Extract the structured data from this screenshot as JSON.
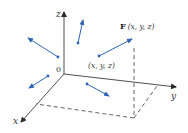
{
  "diagram": {
    "colors": {
      "axis": "#3a3a3a",
      "vector": "#2f64b5",
      "dashed": "#3a3a3a",
      "text": "#333333"
    },
    "axes": {
      "origin_label": "0",
      "x_label": "x",
      "y_label": "y",
      "z_label": "z"
    },
    "point_label": "(x, y, z)",
    "vector_label_bold": "F",
    "vector_label_args": "(x, y, z)",
    "vectors": [
      {
        "from": [
          58,
          57
        ],
        "to": [
          28,
          38
        ]
      },
      {
        "from": [
          78,
          43
        ],
        "to": [
          83,
          20
        ]
      },
      {
        "from": [
          48,
          76
        ],
        "to": [
          29,
          88
        ]
      },
      {
        "from": [
          99,
          56
        ],
        "to": [
          132,
          38
        ]
      },
      {
        "from": [
          87,
          84
        ],
        "to": [
          109,
          96
        ]
      }
    ]
  }
}
